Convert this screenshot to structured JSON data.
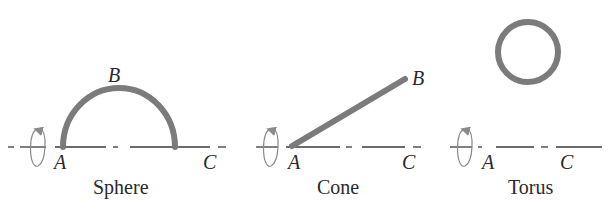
{
  "colors": {
    "curve": "#7b7b7b",
    "axis": "#3a3a3a",
    "rotation_arrow": "#8a8a8a",
    "text": "#2a2a2a",
    "background": "#ffffff"
  },
  "panels": [
    {
      "id": "sphere",
      "caption": "Sphere",
      "labels": {
        "a": "A",
        "b": "B",
        "c": "C"
      },
      "shape": "semicircle-arc",
      "rotation_icon": "rotation-arrow-icon"
    },
    {
      "id": "cone",
      "caption": "Cone",
      "labels": {
        "a": "A",
        "b": "B",
        "c": "C"
      },
      "shape": "inclined-line-segment",
      "rotation_icon": "rotation-arrow-icon"
    },
    {
      "id": "torus",
      "caption": "Torus",
      "labels": {
        "a": "A",
        "c": "C"
      },
      "shape": "circle-above-axis",
      "rotation_icon": "rotation-arrow-icon"
    }
  ]
}
